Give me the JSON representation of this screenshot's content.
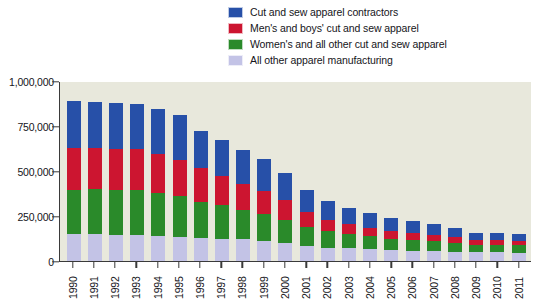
{
  "chart_data": {
    "type": "bar",
    "stacked": true,
    "title": "",
    "xlabel": "",
    "ylabel": "",
    "ylim": [
      0,
      1000000
    ],
    "yticks": [
      0,
      250000,
      500000,
      750000,
      1000000
    ],
    "ytick_labels": [
      "0",
      "250,000",
      "500,000",
      "750,000",
      "1,000,000"
    ],
    "grid": false,
    "legend_position": "top-right",
    "categories": [
      "1990",
      "1991",
      "1992",
      "1993",
      "1994",
      "1995",
      "1996",
      "1997",
      "1998",
      "1999",
      "2000",
      "2001",
      "2002",
      "2003",
      "2004",
      "2005",
      "2006",
      "2007",
      "2008",
      "2009",
      "2010",
      "2011"
    ],
    "series": [
      {
        "name": "All other apparel manufacturing",
        "color": "#c3c3e6",
        "values": [
          150000,
          150000,
          145000,
          145000,
          140000,
          135000,
          130000,
          125000,
          120000,
          110000,
          100000,
          85000,
          75000,
          70000,
          65000,
          60000,
          58000,
          55000,
          52000,
          48000,
          48000,
          47000
        ]
      },
      {
        "name": "Women's and all other cut and sew apparel",
        "color": "#2a8a2a",
        "values": [
          245000,
          250000,
          250000,
          250000,
          240000,
          225000,
          200000,
          185000,
          165000,
          150000,
          130000,
          105000,
          90000,
          80000,
          72000,
          65000,
          60000,
          55000,
          50000,
          42000,
          42000,
          42000
        ]
      },
      {
        "name": "Men's and boys' cut and sew apparel",
        "color": "#cc1530",
        "values": [
          235000,
          230000,
          230000,
          225000,
          215000,
          200000,
          185000,
          165000,
          145000,
          130000,
          110000,
          85000,
          65000,
          55000,
          48000,
          42000,
          38000,
          33000,
          30000,
          25000,
          25000,
          24000
        ]
      },
      {
        "name": "Cut and sew apparel contractors",
        "color": "#2750a8",
        "values": [
          260000,
          255000,
          255000,
          255000,
          250000,
          250000,
          205000,
          200000,
          185000,
          175000,
          150000,
          120000,
          105000,
          90000,
          80000,
          73000,
          68000,
          62000,
          53000,
          42000,
          40000,
          40000
        ]
      }
    ],
    "totals": [
      890000,
      885000,
      880000,
      875000,
      845000,
      810000,
      720000,
      675000,
      615000,
      565000,
      490000,
      395000,
      335000,
      295000,
      265000,
      240000,
      224000,
      205000,
      185000,
      157000,
      155000,
      153000
    ]
  },
  "legend": {
    "items": [
      {
        "label": "Cut and sew apparel contractors",
        "color": "#2750a8"
      },
      {
        "label": "Men's and boys' cut and sew apparel",
        "color": "#cc1530"
      },
      {
        "label": "Women's and all other cut and sew apparel",
        "color": "#2a8a2a"
      },
      {
        "label": "All other apparel manufacturing",
        "color": "#c3c3e6"
      }
    ]
  },
  "colors": {
    "plot_background": "#e8e8dc",
    "page_background": "#ffffff",
    "axis": "#3a3a3a",
    "text": "#15151a"
  }
}
